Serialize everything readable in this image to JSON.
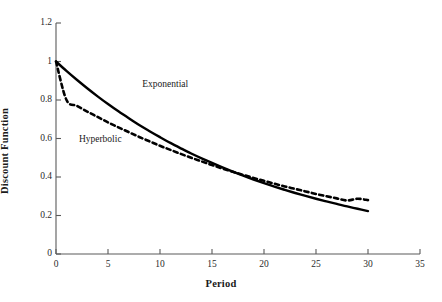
{
  "chart_data": {
    "type": "line",
    "title": "",
    "xlabel": "Period",
    "ylabel": "Discount Function",
    "xlim": [
      0,
      35
    ],
    "ylim": [
      0,
      1.2
    ],
    "grid": false,
    "legend_position": "inline-annotations",
    "xticks": [
      "0",
      "5",
      "10",
      "15",
      "20",
      "25",
      "30",
      "35"
    ],
    "xtick_values": [
      0,
      5,
      10,
      15,
      20,
      25,
      30,
      35
    ],
    "yticks": [
      "0",
      "0.2",
      "0.4",
      "0.6",
      "0.8",
      "1",
      "1.2"
    ],
    "ytick_values": [
      0,
      0.2,
      0.4,
      0.6,
      0.8,
      1,
      1.2
    ],
    "x": [
      0,
      1,
      2,
      3,
      4,
      5,
      6,
      7,
      8,
      9,
      10,
      11,
      12,
      13,
      14,
      15,
      16,
      17,
      18,
      19,
      20,
      21,
      22,
      23,
      24,
      25,
      26,
      27,
      28,
      29,
      30
    ],
    "series": [
      {
        "name": "Exponential",
        "style": "solid",
        "color": "#000000",
        "values": [
          1.0,
          0.951,
          0.905,
          0.861,
          0.819,
          0.779,
          0.741,
          0.705,
          0.67,
          0.638,
          0.607,
          0.577,
          0.549,
          0.522,
          0.497,
          0.473,
          0.45,
          0.428,
          0.407,
          0.387,
          0.368,
          0.35,
          0.333,
          0.317,
          0.302,
          0.287,
          0.273,
          0.26,
          0.247,
          0.235,
          0.223
        ]
      },
      {
        "name": "Hyperbolic",
        "style": "dashed",
        "color": "#000000",
        "values": [
          1.0,
          0.801,
          0.77,
          0.74,
          0.712,
          0.684,
          0.658,
          0.633,
          0.608,
          0.585,
          0.562,
          0.541,
          0.52,
          0.5,
          0.481,
          0.462,
          0.444,
          0.427,
          0.411,
          0.395,
          0.38,
          0.365,
          0.351,
          0.338,
          0.325,
          0.312,
          0.3,
          0.289,
          0.278,
          0.287,
          0.28
        ]
      }
    ],
    "annotations": [
      {
        "text": "Exponential",
        "x": 8.3,
        "y": 0.875
      },
      {
        "text": "Hyperbolic",
        "x": 2.2,
        "y": 0.588
      }
    ]
  }
}
